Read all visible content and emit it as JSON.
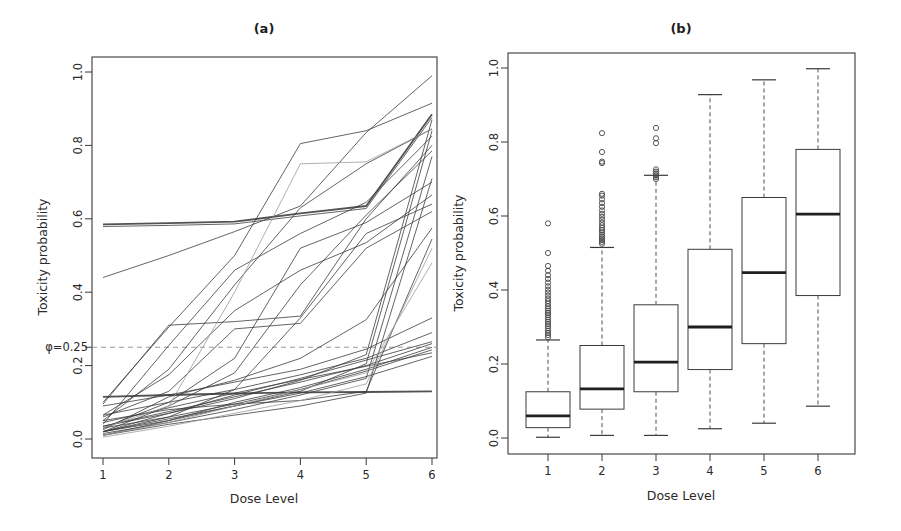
{
  "figure": {
    "background": "#ffffff",
    "ink_color": "#3a3a3a",
    "light_line_color": "#9a9a9a",
    "dash_line_color": "#9a9a9a",
    "median_color": "#1f1f1f"
  },
  "chart_data": [
    {
      "type": "line",
      "title": "(a)",
      "xlabel": "Dose Level",
      "ylabel": "Toxicity probability",
      "x": [
        1,
        2,
        3,
        4,
        5,
        6
      ],
      "xticks": [
        "1",
        "2",
        "3",
        "4",
        "5",
        "6"
      ],
      "yticks": [
        "0.0",
        "0.2",
        "0.4",
        "0.6",
        "0.8",
        "1.0"
      ],
      "ylim": [
        0,
        1
      ],
      "grid": false,
      "legend": "none",
      "reference_line": {
        "label": "φ=0.25",
        "value": 0.25,
        "style": "dashed"
      },
      "series": [
        {
          "name": "curve-01",
          "emphasis": "bold",
          "shade": "dark",
          "values": [
            0.585,
            0.588,
            0.592,
            0.615,
            0.635,
            0.885
          ]
        },
        {
          "name": "curve-02",
          "emphasis": "normal",
          "shade": "dark",
          "values": [
            0.579,
            0.582,
            0.586,
            0.608,
            0.628,
            0.876
          ]
        },
        {
          "name": "curve-03",
          "emphasis": "normal",
          "shade": "dark",
          "values": [
            0.44,
            0.5,
            0.565,
            0.635,
            0.835,
            0.99
          ]
        },
        {
          "name": "curve-04",
          "emphasis": "normal",
          "shade": "dark",
          "values": [
            0.1,
            0.305,
            0.5,
            0.805,
            0.84,
            0.915
          ]
        },
        {
          "name": "curve-05",
          "emphasis": "normal",
          "shade": "dark",
          "values": [
            0.05,
            0.19,
            0.42,
            0.63,
            0.75,
            0.845
          ]
        },
        {
          "name": "curve-06",
          "emphasis": "normal",
          "shade": "dark",
          "values": [
            0.04,
            0.255,
            0.46,
            0.56,
            0.645,
            0.825
          ]
        },
        {
          "name": "curve-07",
          "emphasis": "normal",
          "shade": "dark",
          "values": [
            0.095,
            0.31,
            0.32,
            0.335,
            0.6,
            0.8
          ]
        },
        {
          "name": "curve-08",
          "emphasis": "normal",
          "shade": "dark",
          "values": [
            0.02,
            0.09,
            0.18,
            0.42,
            0.61,
            0.785
          ]
        },
        {
          "name": "curve-09",
          "emphasis": "normal",
          "shade": "dark",
          "values": [
            0.03,
            0.1,
            0.22,
            0.52,
            0.59,
            0.7
          ]
        },
        {
          "name": "curve-10",
          "emphasis": "normal",
          "shade": "dark",
          "values": [
            0.065,
            0.175,
            0.35,
            0.46,
            0.535,
            0.665
          ]
        },
        {
          "name": "curve-11",
          "emphasis": "normal",
          "shade": "dark",
          "values": [
            0.02,
            0.06,
            0.135,
            0.33,
            0.56,
            0.64
          ]
        },
        {
          "name": "curve-12",
          "emphasis": "normal",
          "shade": "dark",
          "values": [
            0.025,
            0.115,
            0.16,
            0.22,
            0.325,
            0.575
          ]
        },
        {
          "name": "curve-13",
          "emphasis": "normal",
          "shade": "dark",
          "values": [
            0.05,
            0.08,
            0.095,
            0.105,
            0.13,
            0.545
          ]
        },
        {
          "name": "curve-14",
          "emphasis": "normal",
          "shade": "dark",
          "values": [
            0.01,
            0.04,
            0.065,
            0.09,
            0.125,
            0.71
          ]
        },
        {
          "name": "curve-15",
          "emphasis": "normal",
          "shade": "dark",
          "values": [
            0.02,
            0.05,
            0.09,
            0.13,
            0.205,
            0.84
          ]
        },
        {
          "name": "curve-16",
          "emphasis": "normal",
          "shade": "dark",
          "values": [
            0.015,
            0.045,
            0.08,
            0.12,
            0.165,
            0.77
          ]
        },
        {
          "name": "curve-17",
          "emphasis": "normal",
          "shade": "dark",
          "values": [
            0.035,
            0.07,
            0.11,
            0.16,
            0.23,
            0.87
          ]
        },
        {
          "name": "curve-18",
          "emphasis": "normal",
          "shade": "dark",
          "values": [
            0.09,
            0.12,
            0.155,
            0.19,
            0.245,
            0.33
          ]
        },
        {
          "name": "curve-19",
          "emphasis": "normal",
          "shade": "dark",
          "values": [
            0.065,
            0.1,
            0.135,
            0.175,
            0.22,
            0.29
          ]
        },
        {
          "name": "curve-20",
          "emphasis": "normal",
          "shade": "dark",
          "values": [
            0.02,
            0.07,
            0.12,
            0.165,
            0.215,
            0.265
          ]
        },
        {
          "name": "curve-21",
          "emphasis": "normal",
          "shade": "dark",
          "values": [
            0.035,
            0.075,
            0.115,
            0.155,
            0.2,
            0.26
          ]
        },
        {
          "name": "curve-22",
          "emphasis": "normal",
          "shade": "dark",
          "values": [
            0.01,
            0.05,
            0.1,
            0.14,
            0.19,
            0.25
          ]
        },
        {
          "name": "curve-23",
          "emphasis": "normal",
          "shade": "dark",
          "values": [
            0.03,
            0.06,
            0.095,
            0.135,
            0.185,
            0.243
          ]
        },
        {
          "name": "curve-24",
          "emphasis": "normal",
          "shade": "dark",
          "values": [
            0.045,
            0.085,
            0.125,
            0.162,
            0.198,
            0.235
          ]
        },
        {
          "name": "curve-25",
          "emphasis": "normal",
          "shade": "dark",
          "values": [
            0.02,
            0.055,
            0.09,
            0.125,
            0.17,
            0.225
          ]
        },
        {
          "name": "curve-26",
          "emphasis": "bold",
          "shade": "dark",
          "values": [
            0.115,
            0.12,
            0.124,
            0.127,
            0.128,
            0.13
          ]
        },
        {
          "name": "curve-27",
          "emphasis": "normal",
          "shade": "light",
          "values": [
            0.005,
            0.035,
            0.07,
            0.105,
            0.15,
            0.52
          ]
        },
        {
          "name": "curve-28",
          "emphasis": "normal",
          "shade": "dark",
          "values": [
            0.06,
            0.13,
            0.3,
            0.315,
            0.52,
            0.62
          ]
        },
        {
          "name": "curve-29",
          "emphasis": "normal",
          "shade": "light",
          "values": [
            0.03,
            0.09,
            0.4,
            0.75,
            0.755,
            0.845
          ]
        },
        {
          "name": "curve-30",
          "emphasis": "normal",
          "shade": "light",
          "values": [
            0.01,
            0.045,
            0.09,
            0.135,
            0.18,
            0.48
          ]
        }
      ]
    },
    {
      "type": "boxplot",
      "title": "(b)",
      "xlabel": "Dose Level",
      "ylabel": "Toxicity probability",
      "categories": [
        "1",
        "2",
        "3",
        "4",
        "5",
        "6"
      ],
      "yticks": [
        "0.0",
        "0.2",
        "0.4",
        "0.6",
        "0.8",
        "1.0"
      ],
      "ylim": [
        0,
        1
      ],
      "grid": false,
      "legend": "none",
      "boxes": [
        {
          "dose": "1",
          "whisker_low": 0.002,
          "q1": 0.028,
          "median": 0.06,
          "q3": 0.125,
          "whisker_high": 0.265,
          "outliers": [
            0.272,
            0.278,
            0.284,
            0.29,
            0.296,
            0.302,
            0.308,
            0.314,
            0.32,
            0.326,
            0.332,
            0.338,
            0.344,
            0.35,
            0.356,
            0.363,
            0.37,
            0.377,
            0.385,
            0.393,
            0.401,
            0.41,
            0.42,
            0.43,
            0.44,
            0.452,
            0.465,
            0.5,
            0.58
          ]
        },
        {
          "dose": "2",
          "whisker_low": 0.007,
          "q1": 0.078,
          "median": 0.133,
          "q3": 0.25,
          "whisker_high": 0.515,
          "outliers": [
            0.525,
            0.53,
            0.535,
            0.54,
            0.545,
            0.55,
            0.556,
            0.562,
            0.568,
            0.575,
            0.582,
            0.59,
            0.598,
            0.606,
            0.615,
            0.625,
            0.635,
            0.645,
            0.655,
            0.66,
            0.743,
            0.747,
            0.773,
            0.824
          ]
        },
        {
          "dose": "3",
          "whisker_low": 0.007,
          "q1": 0.125,
          "median": 0.205,
          "q3": 0.36,
          "whisker_high": 0.71,
          "outliers": [
            0.7,
            0.705,
            0.71,
            0.715,
            0.72,
            0.726,
            0.797,
            0.81,
            0.838
          ]
        },
        {
          "dose": "4",
          "whisker_low": 0.025,
          "q1": 0.185,
          "median": 0.3,
          "q3": 0.51,
          "whisker_high": 0.928,
          "outliers": []
        },
        {
          "dose": "5",
          "whisker_low": 0.04,
          "q1": 0.255,
          "median": 0.447,
          "q3": 0.65,
          "whisker_high": 0.968,
          "outliers": []
        },
        {
          "dose": "6",
          "whisker_low": 0.086,
          "q1": 0.385,
          "median": 0.605,
          "q3": 0.78,
          "whisker_high": 0.998,
          "outliers": []
        }
      ]
    }
  ]
}
